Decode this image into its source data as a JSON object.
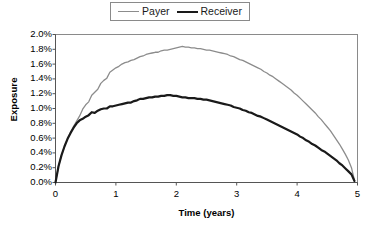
{
  "chart_data": {
    "type": "line",
    "title": "",
    "xlabel": "Time (years)",
    "ylabel": "Exposure",
    "xlim": [
      0,
      5
    ],
    "ylim": [
      0,
      0.02
    ],
    "grid": false,
    "legend_position": "top-center",
    "xticks": [
      "0",
      "1",
      "2",
      "3",
      "4",
      "5"
    ],
    "xtick_values": [
      0,
      1,
      2,
      3,
      4,
      5
    ],
    "yticks": [
      "0.0%",
      "0.2%",
      "0.4%",
      "0.6%",
      "0.8%",
      "1.0%",
      "1.2%",
      "1.4%",
      "1.6%",
      "1.8%",
      "2.0%"
    ],
    "ytick_values": [
      0.0,
      0.2,
      0.4,
      0.6,
      0.8,
      1.0,
      1.2,
      1.4,
      1.6,
      1.8,
      2.0
    ],
    "ytick_unit": "%",
    "x": [
      0.0,
      0.05,
      0.1,
      0.15,
      0.2,
      0.25,
      0.3,
      0.35,
      0.4,
      0.45,
      0.5,
      0.55,
      0.6,
      0.65,
      0.7,
      0.75,
      0.8,
      0.85,
      0.9,
      0.95,
      1.0,
      1.05,
      1.1,
      1.15,
      1.2,
      1.25,
      1.3,
      1.35,
      1.4,
      1.45,
      1.5,
      1.55,
      1.6,
      1.65,
      1.7,
      1.75,
      1.8,
      1.85,
      1.9,
      1.95,
      2.0,
      2.05,
      2.1,
      2.15,
      2.2,
      2.25,
      2.3,
      2.35,
      2.4,
      2.45,
      2.5,
      2.55,
      2.6,
      2.65,
      2.7,
      2.75,
      2.8,
      2.85,
      2.9,
      2.95,
      3.0,
      3.05,
      3.1,
      3.15,
      3.2,
      3.25,
      3.3,
      3.35,
      3.4,
      3.45,
      3.5,
      3.55,
      3.6,
      3.65,
      3.7,
      3.75,
      3.8,
      3.85,
      3.9,
      3.95,
      4.0,
      4.05,
      4.1,
      4.15,
      4.2,
      4.25,
      4.3,
      4.35,
      4.4,
      4.45,
      4.5,
      4.55,
      4.6,
      4.65,
      4.7,
      4.75,
      4.8,
      4.85,
      4.9,
      4.95
    ],
    "series": [
      {
        "name": "Payer",
        "color": "#8c8c8c",
        "width": 1.3,
        "peak_value": 1.84,
        "peak_time": 2.0,
        "values": [
          0.0,
          0.22,
          0.37,
          0.49,
          0.59,
          0.68,
          0.76,
          0.83,
          0.9,
          0.99,
          1.05,
          1.09,
          1.18,
          1.22,
          1.26,
          1.34,
          1.38,
          1.41,
          1.49,
          1.52,
          1.55,
          1.57,
          1.6,
          1.62,
          1.63,
          1.65,
          1.66,
          1.68,
          1.7,
          1.71,
          1.73,
          1.74,
          1.75,
          1.76,
          1.76,
          1.78,
          1.79,
          1.79,
          1.8,
          1.81,
          1.82,
          1.83,
          1.84,
          1.83,
          1.83,
          1.82,
          1.82,
          1.81,
          1.81,
          1.8,
          1.79,
          1.79,
          1.78,
          1.77,
          1.76,
          1.75,
          1.74,
          1.73,
          1.71,
          1.7,
          1.68,
          1.66,
          1.65,
          1.63,
          1.61,
          1.59,
          1.57,
          1.55,
          1.53,
          1.5,
          1.48,
          1.45,
          1.43,
          1.4,
          1.37,
          1.34,
          1.31,
          1.28,
          1.25,
          1.21,
          1.18,
          1.14,
          1.1,
          1.06,
          1.02,
          0.98,
          0.94,
          0.89,
          0.85,
          0.8,
          0.75,
          0.7,
          0.64,
          0.58,
          0.52,
          0.45,
          0.38,
          0.3,
          0.2,
          0.03
        ]
      },
      {
        "name": "Receiver",
        "color": "#1a1a1a",
        "width": 2.2,
        "peak_value": 1.18,
        "peak_time": 1.6,
        "values": [
          0.0,
          0.22,
          0.37,
          0.49,
          0.59,
          0.67,
          0.74,
          0.8,
          0.84,
          0.86,
          0.89,
          0.91,
          0.95,
          0.94,
          0.97,
          0.99,
          1.0,
          1.0,
          1.03,
          1.03,
          1.04,
          1.05,
          1.06,
          1.07,
          1.08,
          1.08,
          1.1,
          1.11,
          1.13,
          1.13,
          1.14,
          1.15,
          1.15,
          1.16,
          1.16,
          1.17,
          1.17,
          1.18,
          1.18,
          1.17,
          1.17,
          1.16,
          1.15,
          1.15,
          1.14,
          1.14,
          1.14,
          1.13,
          1.13,
          1.12,
          1.12,
          1.11,
          1.1,
          1.09,
          1.08,
          1.07,
          1.06,
          1.05,
          1.04,
          1.02,
          1.01,
          1.0,
          0.98,
          0.97,
          0.95,
          0.94,
          0.92,
          0.9,
          0.89,
          0.87,
          0.85,
          0.83,
          0.81,
          0.79,
          0.77,
          0.75,
          0.73,
          0.71,
          0.69,
          0.67,
          0.65,
          0.62,
          0.6,
          0.57,
          0.55,
          0.52,
          0.5,
          0.47,
          0.44,
          0.42,
          0.39,
          0.36,
          0.33,
          0.3,
          0.26,
          0.23,
          0.19,
          0.15,
          0.11,
          0.02
        ]
      }
    ]
  },
  "legend": {
    "entries": [
      {
        "label": "Payer"
      },
      {
        "label": "Receiver"
      }
    ]
  },
  "axes": {
    "x_title": "Time (years)",
    "y_title": "Exposure"
  },
  "colors": {
    "payer": "#8c8c8c",
    "receiver": "#1a1a1a",
    "frame": "#8a8a8a",
    "axis": "#000000",
    "background": "#ffffff"
  }
}
